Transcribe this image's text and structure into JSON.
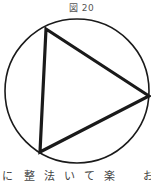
{
  "figure": {
    "title": "図 20",
    "stroke_color": "#1a1a1a",
    "circle": {
      "cx": 77,
      "cy": 91,
      "r": 72
    },
    "triangle": {
      "vertices": [
        [
          46,
          29
        ],
        [
          149,
          96
        ],
        [
          40,
          152
        ]
      ]
    }
  },
  "caption": {
    "chars": [
      {
        "text": "に",
        "x": 2
      },
      {
        "text": "整",
        "x": 24
      },
      {
        "text": "法",
        "x": 44
      },
      {
        "text": "い",
        "x": 64
      },
      {
        "text": "て",
        "x": 84
      },
      {
        "text": "楽",
        "x": 104
      },
      {
        "text": "お",
        "x": 143
      }
    ]
  }
}
